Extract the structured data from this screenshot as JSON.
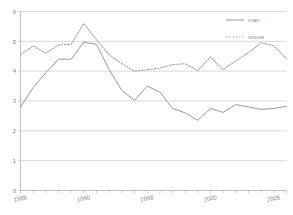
{
  "chart_data": {
    "type": "line",
    "title": "",
    "subtitle": "",
    "xlabel": "",
    "ylabel": "",
    "xlim": [
      1985,
      2006
    ],
    "ylim": [
      0,
      6
    ],
    "grid": true,
    "grid_axis": "y",
    "legend_position": "top-right",
    "x": [
      1985,
      1986,
      1987,
      1988,
      1989,
      1990,
      1991,
      1992,
      1993,
      1994,
      1995,
      1996,
      1997,
      1998,
      1999,
      2000,
      2001,
      2002,
      2003,
      2004,
      2005,
      2006
    ],
    "x_tick_labels": [
      "1985",
      "1990",
      "1995",
      "2000",
      "2005"
    ],
    "x_ticks": [
      1985,
      1990,
      1995,
      2000,
      2005
    ],
    "y_tick_labels": [
      "0",
      "1",
      "2",
      "3",
      "4",
      "5",
      "6"
    ],
    "y_ticks": [
      0,
      1,
      2,
      3,
      4,
      5,
      6
    ],
    "series": [
      {
        "name": "man",
        "style": "solid",
        "color": "#9a9a9a",
        "values": [
          2.8,
          3.45,
          3.95,
          4.4,
          4.4,
          4.97,
          4.9,
          4.05,
          3.35,
          3.02,
          3.5,
          3.3,
          2.75,
          2.6,
          2.35,
          2.75,
          2.62,
          2.88,
          2.8,
          2.72,
          2.75,
          2.82
        ]
      },
      {
        "name": "vrouw",
        "style": "dotted",
        "color": "#a8a8a8",
        "values": [
          4.55,
          4.85,
          4.6,
          4.88,
          4.9,
          5.6,
          5.05,
          4.55,
          4.25,
          4.0,
          4.05,
          4.1,
          4.22,
          4.25,
          4.02,
          4.48,
          4.05,
          4.35,
          4.62,
          4.95,
          4.85,
          4.42
        ]
      }
    ]
  },
  "legend": {
    "items": [
      {
        "label": "man",
        "style": "solid"
      },
      {
        "label": "vrouw",
        "style": "dotted"
      }
    ]
  },
  "axes": {
    "y_axis_label": "",
    "x_axis_label": ""
  }
}
